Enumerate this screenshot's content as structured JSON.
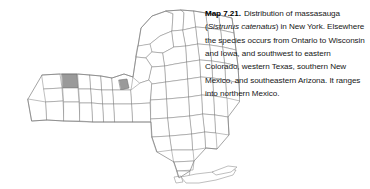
{
  "figure": {
    "kind": "distribution-map",
    "region": "New York",
    "background_color": "#ffffff"
  },
  "caption": {
    "label": "Map 7.21.",
    "body_before_sciname": "Distribution of massasauga (",
    "scientific_name": "Sistrurus catenatus",
    "body_after_sciname": ") in New York. Elsewhere the species occurs from Ontario to Wisconsin and Iowa, and southwest to eastern Colorado, western Texas, southern New Mexico, and southeastern Arizona. It ranges into northern Mexico.",
    "lines": [
      "Map 7.21.  Distribution of massasauga",
      "(Sistrurus catenatus) in New York. Elsewhere",
      "the species occurs from Ontario to Wisconsin",
      "and Iowa, and southwest to eastern Colorado,",
      "western Texas, southern New Mexico, and",
      "southeastern Arizona. It ranges into northern",
      "Mexico."
    ]
  },
  "map": {
    "title": "New York State county map",
    "county_fill": "#ffffff",
    "county_border": "#8a8a8a",
    "occupied_fill": "#9a9a9a",
    "occupied_count": 2,
    "occupied_localities": [
      {
        "id": "western-locality",
        "approx_x": 69,
        "approx_y": 87
      },
      {
        "id": "central-locality",
        "approx_x": 123,
        "approx_y": 86
      }
    ],
    "features": [
      "state-outline",
      "county-boundaries",
      "long-island",
      "shaded-occurrence-counties"
    ]
  }
}
